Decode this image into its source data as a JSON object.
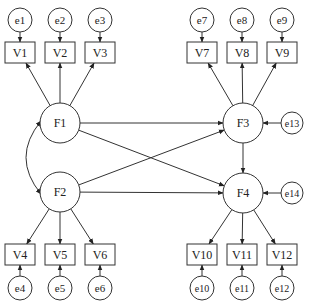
{
  "diagram": {
    "type": "structural-equation-model",
    "colors": {
      "line": "#333333",
      "fill": "#ffffff",
      "text": "#222222"
    },
    "latent_factors": [
      {
        "id": "F1",
        "label": "F1",
        "cx": 60,
        "cy": 123,
        "r": 20
      },
      {
        "id": "F2",
        "label": "F2",
        "cx": 60,
        "cy": 192,
        "r": 20
      },
      {
        "id": "F3",
        "label": "F3",
        "cx": 243,
        "cy": 123,
        "r": 20
      },
      {
        "id": "F4",
        "label": "F4",
        "cx": 243,
        "cy": 193,
        "r": 20
      }
    ],
    "observed_variables": [
      {
        "id": "V1",
        "label": "V1",
        "x": 5,
        "y": 42,
        "w": 30,
        "h": 21
      },
      {
        "id": "V2",
        "label": "V2",
        "x": 45,
        "y": 42,
        "w": 30,
        "h": 21
      },
      {
        "id": "V3",
        "label": "V3",
        "x": 85,
        "y": 42,
        "w": 30,
        "h": 21
      },
      {
        "id": "V4",
        "label": "V4",
        "x": 5,
        "y": 244,
        "w": 30,
        "h": 21
      },
      {
        "id": "V5",
        "label": "V5",
        "x": 45,
        "y": 244,
        "w": 30,
        "h": 21
      },
      {
        "id": "V6",
        "label": "V6",
        "x": 85,
        "y": 244,
        "w": 30,
        "h": 21
      },
      {
        "id": "V7",
        "label": "V7",
        "x": 187,
        "y": 42,
        "w": 30,
        "h": 21
      },
      {
        "id": "V8",
        "label": "V8",
        "x": 227,
        "y": 42,
        "w": 30,
        "h": 21
      },
      {
        "id": "V9",
        "label": "V9",
        "x": 267,
        "y": 42,
        "w": 30,
        "h": 21
      },
      {
        "id": "V10",
        "label": "V10",
        "x": 187,
        "y": 244,
        "w": 30,
        "h": 21
      },
      {
        "id": "V11",
        "label": "V11",
        "x": 227,
        "y": 244,
        "w": 30,
        "h": 21
      },
      {
        "id": "V12",
        "label": "V12",
        "x": 267,
        "y": 244,
        "w": 30,
        "h": 21
      }
    ],
    "error_terms": [
      {
        "id": "e1",
        "label": "e1",
        "cx": 20,
        "cy": 20,
        "r": 12
      },
      {
        "id": "e2",
        "label": "e2",
        "cx": 60,
        "cy": 20,
        "r": 12
      },
      {
        "id": "e3",
        "label": "e3",
        "cx": 100,
        "cy": 20,
        "r": 12
      },
      {
        "id": "e4",
        "label": "e4",
        "cx": 20,
        "cy": 288,
        "r": 12
      },
      {
        "id": "e5",
        "label": "e5",
        "cx": 60,
        "cy": 288,
        "r": 12
      },
      {
        "id": "e6",
        "label": "e6",
        "cx": 100,
        "cy": 288,
        "r": 12
      },
      {
        "id": "e7",
        "label": "e7",
        "cx": 202,
        "cy": 20,
        "r": 12
      },
      {
        "id": "e8",
        "label": "e8",
        "cx": 242,
        "cy": 20,
        "r": 12
      },
      {
        "id": "e9",
        "label": "e9",
        "cx": 282,
        "cy": 20,
        "r": 12
      },
      {
        "id": "e10",
        "label": "e10",
        "cx": 202,
        "cy": 288,
        "r": 12
      },
      {
        "id": "e11",
        "label": "e11",
        "cx": 242,
        "cy": 288,
        "r": 12
      },
      {
        "id": "e12",
        "label": "e12",
        "cx": 282,
        "cy": 288,
        "r": 12
      },
      {
        "id": "e13",
        "label": "e13",
        "cx": 292,
        "cy": 123,
        "r": 11
      },
      {
        "id": "e14",
        "label": "e14",
        "cx": 292,
        "cy": 193,
        "r": 11
      }
    ],
    "paths": [
      {
        "from": "e1",
        "to": "V1"
      },
      {
        "from": "e2",
        "to": "V2"
      },
      {
        "from": "e3",
        "to": "V3"
      },
      {
        "from": "e4",
        "to": "V4"
      },
      {
        "from": "e5",
        "to": "V5"
      },
      {
        "from": "e6",
        "to": "V6"
      },
      {
        "from": "e7",
        "to": "V7"
      },
      {
        "from": "e8",
        "to": "V8"
      },
      {
        "from": "e9",
        "to": "V9"
      },
      {
        "from": "e10",
        "to": "V10"
      },
      {
        "from": "e11",
        "to": "V11"
      },
      {
        "from": "e12",
        "to": "V12"
      },
      {
        "from": "F1",
        "to": "V1"
      },
      {
        "from": "F1",
        "to": "V2"
      },
      {
        "from": "F1",
        "to": "V3"
      },
      {
        "from": "F2",
        "to": "V4"
      },
      {
        "from": "F2",
        "to": "V5"
      },
      {
        "from": "F2",
        "to": "V6"
      },
      {
        "from": "F3",
        "to": "V7"
      },
      {
        "from": "F3",
        "to": "V8"
      },
      {
        "from": "F3",
        "to": "V9"
      },
      {
        "from": "F4",
        "to": "V10"
      },
      {
        "from": "F4",
        "to": "V11"
      },
      {
        "from": "F4",
        "to": "V12"
      },
      {
        "from": "F1",
        "to": "F3"
      },
      {
        "from": "F1",
        "to": "F4"
      },
      {
        "from": "F2",
        "to": "F3"
      },
      {
        "from": "F2",
        "to": "F4"
      },
      {
        "from": "F3",
        "to": "F4"
      },
      {
        "from": "e13",
        "to": "F3"
      },
      {
        "from": "e14",
        "to": "F4"
      }
    ],
    "covariances": [
      {
        "between": [
          "F1",
          "F2"
        ],
        "label": ""
      }
    ]
  }
}
